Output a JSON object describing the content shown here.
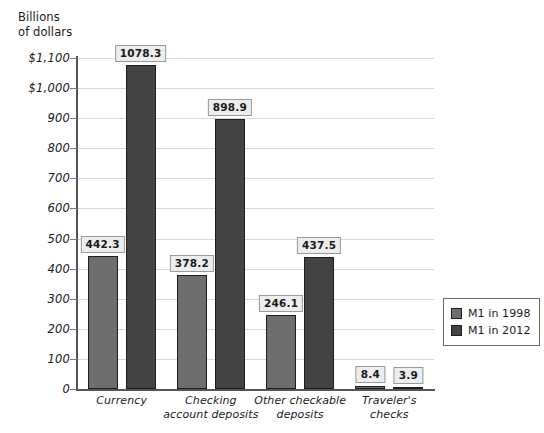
{
  "chart_data": {
    "type": "bar",
    "title": "",
    "xlabel": "",
    "ylabel": "Billions\nof dollars",
    "ylim": [
      0,
      1100
    ],
    "ytick_step": 100,
    "grid": true,
    "legend_position": "right",
    "categories": [
      "Currency",
      "Checking\naccount deposits",
      "Other checkable\ndeposits",
      "Traveler's\nchecks"
    ],
    "series": [
      {
        "name": "M1 in 1998",
        "color": "#6e6e6e",
        "values": [
          442.3,
          378.2,
          246.1,
          8.4
        ],
        "value_labels": [
          "442.3",
          "378.2",
          "246.1",
          "8.4"
        ]
      },
      {
        "name": "M1 in 2012",
        "color": "#434343",
        "values": [
          1078.3,
          898.9,
          437.5,
          3.9
        ],
        "value_labels": [
          "1078.3",
          "898.9",
          "437.5",
          "3.9"
        ]
      }
    ],
    "ytick_labels": [
      "$1,100",
      "$1,000",
      "900",
      "800",
      "700",
      "600",
      "500",
      "400",
      "300",
      "200",
      "100",
      "0"
    ],
    "ytick_values": [
      1100,
      1000,
      900,
      800,
      700,
      600,
      500,
      400,
      300,
      200,
      100,
      0
    ]
  },
  "legend": {
    "items": [
      {
        "label": "M1 in 1998"
      },
      {
        "label": "M1 in 2012"
      }
    ]
  }
}
